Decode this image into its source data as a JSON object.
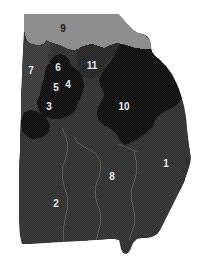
{
  "map": {
    "title": "Georgia congressional districts",
    "type": "choropleth-district-map",
    "outline_color": "#ffffff",
    "background_color": "#ffffff",
    "boundary_line_color": "#6b6b6b",
    "shade_palette": {
      "lightest": "#8a8a8a",
      "light": "#3c3c3c",
      "mid": "#333333",
      "dark": "#2b2b2b",
      "darkest": "#0d0d0d"
    },
    "districts": [
      {
        "id": "1",
        "label": "1",
        "label_x": 166,
        "label_y": 164,
        "label_color": "light",
        "fill": "#2f2f2f"
      },
      {
        "id": "2",
        "label": "2",
        "label_x": 56,
        "label_y": 204,
        "label_color": "light",
        "fill": "#2f2f2f"
      },
      {
        "id": "3",
        "label": "3",
        "label_x": 49,
        "label_y": 107,
        "label_color": "light",
        "fill": "#0d0d0d"
      },
      {
        "id": "4",
        "label": "4",
        "label_x": 68,
        "label_y": 85,
        "label_color": "light",
        "fill": "#0d0d0d"
      },
      {
        "id": "5",
        "label": "5",
        "label_x": 56,
        "label_y": 88,
        "label_color": "light",
        "fill": "#0d0d0d"
      },
      {
        "id": "6",
        "label": "6",
        "label_x": 58,
        "label_y": 68,
        "label_color": "light",
        "fill": "#0d0d0d"
      },
      {
        "id": "7",
        "label": "7",
        "label_x": 31,
        "label_y": 71,
        "label_color": "light",
        "fill": "#3a3a3a"
      },
      {
        "id": "8",
        "label": "8",
        "label_x": 112,
        "label_y": 177,
        "label_color": "light",
        "fill": "#2f2f2f"
      },
      {
        "id": "9",
        "label": "9",
        "label_x": 63,
        "label_y": 29,
        "label_color": "dark",
        "fill": "#8a8a8a"
      },
      {
        "id": "10",
        "label": "10",
        "label_x": 124,
        "label_y": 107,
        "label_color": "light",
        "fill": "#0d0d0d"
      },
      {
        "id": "11",
        "label": "11",
        "label_x": 92,
        "label_y": 66,
        "label_color": "light",
        "fill": "#242424"
      }
    ]
  }
}
